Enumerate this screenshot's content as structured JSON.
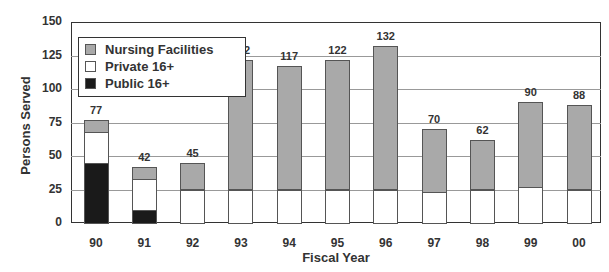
{
  "chart_data": {
    "type": "bar",
    "stacked": true,
    "title": "",
    "xlabel": "Fiscal Year",
    "ylabel": "Persons Served",
    "ylim": [
      0,
      150
    ],
    "yticks": [
      0,
      25,
      50,
      75,
      100,
      125,
      150
    ],
    "grid": true,
    "legend_position": "upper-left",
    "categories": [
      "90",
      "91",
      "92",
      "93",
      "94",
      "95",
      "96",
      "97",
      "98",
      "99",
      "00"
    ],
    "series": [
      {
        "name": "Public 16+",
        "color": "#1a1a1a",
        "values": [
          45,
          10,
          0,
          0,
          0,
          0,
          0,
          0,
          0,
          0,
          0
        ]
      },
      {
        "name": "Private 16+",
        "color": "#ffffff",
        "values": [
          23,
          23,
          25,
          25,
          25,
          25,
          25,
          23,
          25,
          27,
          25
        ]
      },
      {
        "name": "Nursing Facilities",
        "color": "#a9a9a9",
        "values": [
          9,
          9,
          20,
          97,
          92,
          97,
          107,
          47,
          37,
          63,
          63
        ]
      }
    ],
    "totals": [
      77,
      42,
      45,
      122,
      117,
      122,
      132,
      70,
      62,
      90,
      88
    ]
  },
  "legend": {
    "items": [
      {
        "label": "Nursing Facilities",
        "color": "#a9a9a9"
      },
      {
        "label": "Private 16+",
        "color": "#ffffff"
      },
      {
        "label": "Public 16+",
        "color": "#1a1a1a"
      }
    ]
  },
  "axes": {
    "x_title": "Fiscal Year",
    "y_title": "Persons Served"
  }
}
